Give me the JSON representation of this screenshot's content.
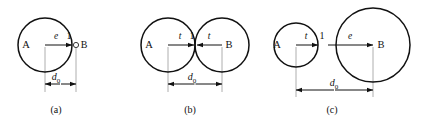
{
  "figure": {
    "background_color": "#ffffff",
    "stroke_color": "#111111",
    "extension_line_color": "#9a9a9a",
    "panels": [
      {
        "caption": "(a)",
        "caption_x": 56,
        "caption_y": 113,
        "description": "large circle A with separate point B, gap e",
        "circles": [
          {
            "name": "circle-a",
            "cx": 45,
            "cy": 45,
            "r": 27,
            "label": "A",
            "label_x": 26,
            "label_y": 48
          }
        ],
        "point_markers": [
          {
            "name": "point-b",
            "cx": 76,
            "cy": 45,
            "r": 2.6
          }
        ],
        "node_labels": [
          {
            "name": "node-label-b",
            "text": "B",
            "x": 84,
            "y": 48
          }
        ],
        "contact_labels": [
          {
            "name": "contact-label-1",
            "text": "1",
            "x": 69,
            "y": 39
          }
        ],
        "gap_arrows": [
          {
            "name": "gap-arrow-e",
            "label": "e",
            "x1": 45,
            "x2": 72,
            "y": 45,
            "label_x": 56,
            "label_y": 39
          }
        ],
        "dimension": {
          "name": "dimension-d0",
          "label": "d",
          "sublabel": "0",
          "x1": 45,
          "x2": 76,
          "y": 84,
          "label_x": 56,
          "label_y": 80,
          "ext_lines": [
            {
              "x": 45,
              "y1": 47,
              "y2": 92
            },
            {
              "x": 76,
              "y1": 47,
              "y2": 92
            }
          ]
        }
      },
      {
        "caption": "(b)",
        "caption_x": 190,
        "caption_y": 113,
        "description": "two equal tangent circles A and B, overlap t on each side",
        "circles": [
          {
            "name": "circle-a",
            "cx": 168,
            "cy": 45,
            "r": 27,
            "label": "A",
            "label_x": 149,
            "label_y": 48
          },
          {
            "name": "circle-b",
            "cx": 222,
            "cy": 45,
            "r": 27,
            "label": "B",
            "label_x": 229,
            "label_y": 48
          }
        ],
        "point_markers": [],
        "node_labels": [],
        "contact_labels": [
          {
            "name": "contact-label-1",
            "text": "1",
            "x": 192,
            "y": 39
          }
        ],
        "gap_arrows": [
          {
            "name": "gap-arrow-t-left",
            "label": "t",
            "x1": 168,
            "x2": 194,
            "y": 45,
            "label_x": 180,
            "label_y": 39
          },
          {
            "name": "gap-arrow-t-right",
            "label": "t",
            "x1": 222,
            "x2": 197,
            "y": 45,
            "label_x": 209,
            "label_y": 39
          }
        ],
        "dimension": {
          "name": "dimension-d0",
          "label": "d",
          "sublabel": "0",
          "x1": 168,
          "x2": 222,
          "y": 84,
          "label_x": 192,
          "label_y": 80,
          "ext_lines": [
            {
              "x": 168,
              "y1": 47,
              "y2": 92
            },
            {
              "x": 222,
              "y1": 47,
              "y2": 92
            }
          ]
        }
      },
      {
        "caption": "(c)",
        "caption_x": 332,
        "caption_y": 113,
        "description": "small circle A tangent to large circle B, t on left and e on right",
        "circles": [
          {
            "name": "circle-a",
            "cx": 296,
            "cy": 45,
            "r": 22,
            "label": "A",
            "label_x": 277,
            "label_y": 48
          },
          {
            "name": "circle-b",
            "cx": 373,
            "cy": 45,
            "r": 37,
            "label": "B",
            "label_x": 381,
            "label_y": 48
          }
        ],
        "point_markers": [],
        "node_labels": [],
        "contact_labels": [
          {
            "name": "contact-label-1",
            "text": "1",
            "x": 322,
            "y": 39
          }
        ],
        "gap_arrows": [
          {
            "name": "gap-arrow-t",
            "label": "t",
            "x1": 296,
            "x2": 318,
            "y": 45,
            "label_x": 306,
            "label_y": 39
          },
          {
            "name": "gap-arrow-e",
            "label": "e",
            "x1": 328,
            "x2": 373,
            "y": 45,
            "label_x": 350,
            "label_y": 39
          }
        ],
        "dimension": {
          "name": "dimension-d0",
          "label": "d",
          "sublabel": "0",
          "x1": 296,
          "x2": 373,
          "y": 90,
          "label_x": 334,
          "label_y": 86,
          "ext_lines": [
            {
              "x": 296,
              "y1": 47,
              "y2": 97
            },
            {
              "x": 373,
              "y1": 47,
              "y2": 97
            }
          ]
        }
      }
    ]
  }
}
